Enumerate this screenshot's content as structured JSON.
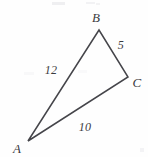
{
  "figure": {
    "type": "geometry-diagram",
    "shape": "triangle",
    "stroke_color": "#45454a",
    "background_color": "#fefefe",
    "vertices": [
      {
        "name": "A",
        "label": "A",
        "point_x": 28,
        "point_y": 141,
        "label_x": 17,
        "label_y": 148
      },
      {
        "name": "B",
        "label": "B",
        "point_x": 99,
        "point_y": 30,
        "label_x": 96,
        "label_y": 17
      },
      {
        "name": "C",
        "label": "C",
        "point_x": 128,
        "point_y": 77,
        "label_x": 137,
        "label_y": 82
      }
    ],
    "sides": [
      {
        "name": "AB",
        "label": "12",
        "label_x": 51,
        "label_y": 70
      },
      {
        "name": "BC",
        "label": "5",
        "label_x": 121,
        "label_y": 45
      },
      {
        "name": "AC",
        "label": "10",
        "label_x": 85,
        "label_y": 127
      }
    ]
  }
}
